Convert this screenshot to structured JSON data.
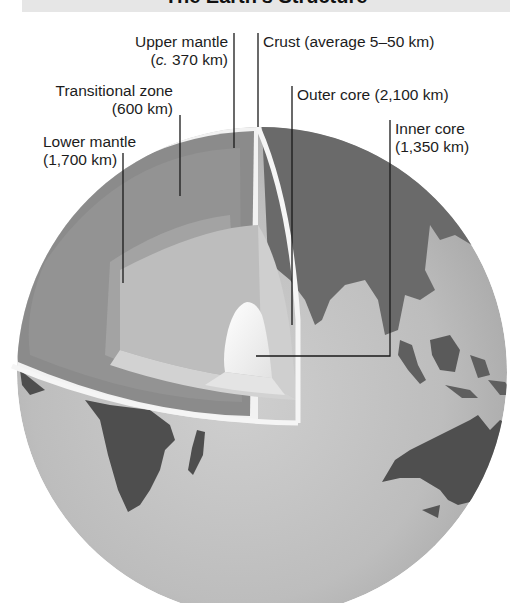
{
  "title": "The Earth's Structure",
  "labels": {
    "upper_mantle": {
      "line1": "Upper mantle",
      "line2_prefix": "c.",
      "line2_rest": " 370 km)",
      "line2_open": "("
    },
    "crust": {
      "text": "Crust (average 5–50 km)"
    },
    "transitional_zone": {
      "line1": "Transitional zone",
      "line2": "(600 km)"
    },
    "outer_core": {
      "text": "Outer core (2,100 km)"
    },
    "lower_mantle": {
      "line1": "Lower mantle",
      "line2": "(1,700 km)"
    },
    "inner_core": {
      "line1": "Inner core",
      "line2": "(1,350 km)"
    }
  },
  "layers": [
    {
      "name": "Crust",
      "thickness": "average 5–50 km"
    },
    {
      "name": "Upper mantle",
      "thickness": "c. 370 km"
    },
    {
      "name": "Transitional zone",
      "thickness": "600 km"
    },
    {
      "name": "Lower mantle",
      "thickness": "1,700 km"
    },
    {
      "name": "Outer core",
      "thickness": "2,100 km"
    },
    {
      "name": "Inner core",
      "thickness": "1,350 km"
    }
  ],
  "colors": {
    "ocean": "#b9b9b9",
    "land": "#5f5f5f",
    "crust_edge": "#f2f2f2",
    "upper_mantle": "#8a8a8a",
    "transitional_zone": "#959595",
    "lower_mantle": "#a4a4a4",
    "outer_core": "#c4c4c4",
    "inner_core": "#f4f4f4",
    "leader_line": "#1a1a1a"
  }
}
